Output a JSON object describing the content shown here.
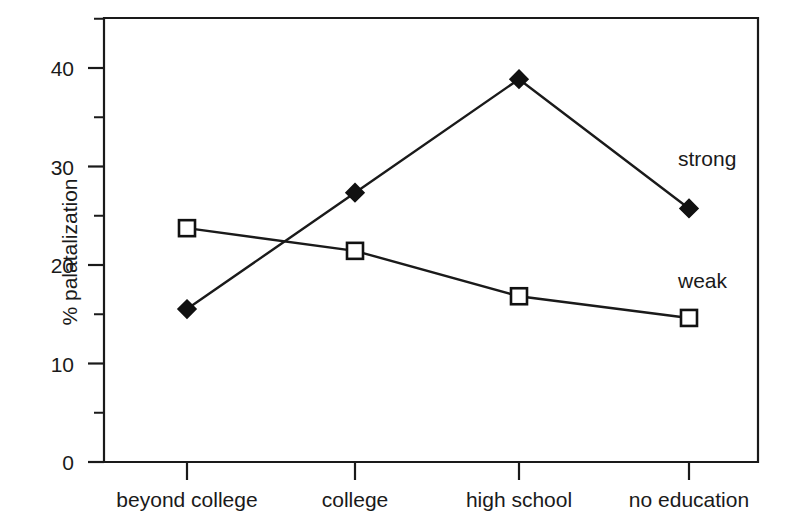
{
  "chart_data": {
    "type": "line",
    "title": "",
    "xlabel": "",
    "ylabel": "% palatalization",
    "categories": [
      "beyond college",
      "college",
      "high school",
      "no education"
    ],
    "ylim": [
      0,
      45
    ],
    "yticks": [
      0,
      10,
      20,
      30,
      40
    ],
    "yticks_minor": [
      5,
      15,
      25,
      35,
      45
    ],
    "ytick_labels": [
      "0",
      "10",
      "20",
      "30",
      "40"
    ],
    "grid": false,
    "legend_position": "inline-annotation",
    "series": [
      {
        "name": "strong",
        "marker": "filled-diamond",
        "values": [
          15.5,
          27.3,
          38.8,
          25.7
        ]
      },
      {
        "name": "weak",
        "marker": "open-square",
        "values": [
          23.7,
          21.4,
          16.8,
          14.6
        ]
      }
    ],
    "annotations": [
      {
        "text": "strong",
        "x": 678,
        "y": 148
      },
      {
        "text": "weak",
        "x": 678,
        "y": 270
      }
    ],
    "colors": {
      "axis": "#1a1a1a",
      "line": "#1a1a1a",
      "marker_fill_strong": "#111111",
      "marker_fill_weak": "#ffffff",
      "background": "#ffffff"
    }
  }
}
